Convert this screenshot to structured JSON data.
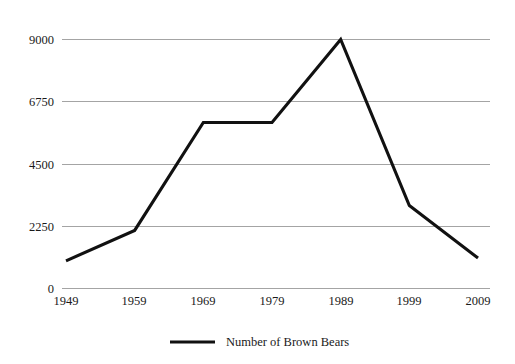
{
  "chart_data": {
    "type": "line",
    "title": "",
    "subtitle": "",
    "xlabel": "",
    "ylabel": "",
    "categories": [
      "1949",
      "1959",
      "1969",
      "1979",
      "1989",
      "1999",
      "2009"
    ],
    "series": [
      {
        "name": "Number of Brown Bears",
        "values": [
          1000,
          2100,
          6000,
          6000,
          9000,
          3000,
          1100
        ],
        "color": "#111111"
      }
    ],
    "ylim": [
      0,
      9000
    ],
    "yticks": [
      0,
      2250,
      4500,
      6750,
      9000
    ],
    "ytick_labels": [
      "0",
      "2250",
      "4500",
      "6750",
      "9000"
    ],
    "xtick_labels": [
      "1949",
      "1959",
      "1969",
      "1979",
      "1989",
      "1999",
      "2009"
    ],
    "grid": {
      "horizontal": true,
      "vertical": false,
      "color": "#9a9a9a"
    },
    "legend": {
      "position": "bottom",
      "entries": [
        {
          "label": "Number of Brown Bears",
          "color": "#111111",
          "marker": "line"
        }
      ]
    },
    "background_color": "#ffffff"
  },
  "legend": {
    "entry_label": "Number of Brown Bears"
  },
  "axes": {
    "y": {
      "tick_0": "0",
      "tick_1": "2250",
      "tick_2": "4500",
      "tick_3": "6750",
      "tick_4": "9000"
    },
    "x": {
      "tick_0": "1949",
      "tick_1": "1959",
      "tick_2": "1969",
      "tick_3": "1979",
      "tick_4": "1989",
      "tick_5": "1999",
      "tick_6": "2009"
    }
  }
}
